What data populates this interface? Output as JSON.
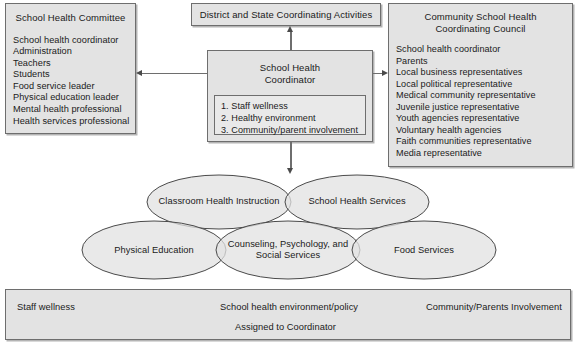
{
  "committee": {
    "title": "School Health Committee",
    "members": [
      "School health coordinator",
      "Administration",
      "Teachers",
      "Students",
      "Food service leader",
      "Physical education leader",
      "Mental health professional",
      "Health services professional"
    ]
  },
  "district": {
    "title": "District and State Coordinating Activities"
  },
  "council": {
    "title": "Community School Health Coordinating Council",
    "members": [
      "School health coordinator",
      "Parents",
      "Local business representatives",
      "Local political representative",
      "Medical community representative",
      "Juvenile justice representative",
      "Youth agencies representative",
      "Voluntary health agencies",
      "Faith communities representative",
      "Media representative"
    ]
  },
  "coordinator": {
    "title_line1": "School Health",
    "title_line2": "Coordinator",
    "tasks": [
      "1. Staff wellness",
      "2. Healthy environment",
      "3. Community/parent involvement"
    ]
  },
  "components": {
    "classroom_health_instruction": "Classroom Health Instruction",
    "school_health_services": "School Health Services",
    "physical_education": "Physical Education",
    "counseling_line1": "Counseling, Psychology, and",
    "counseling_line2": "Social Services",
    "food_services": "Food Services"
  },
  "bottom": {
    "staff_wellness": "Staff wellness",
    "environment_policy": "School health environment/policy",
    "community_involvement": "Community/Parents Involvement",
    "assigned": "Assigned to Coordinator"
  },
  "colors": {
    "fill": "#e3e3e3",
    "stroke": "#6e6e6e",
    "text": "#1a1a1a"
  }
}
